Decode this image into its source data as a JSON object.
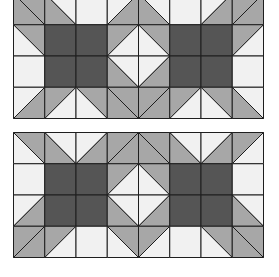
{
  "colors": {
    "white": "#f1f1f1",
    "gray": "#a7a7a7",
    "dark": "#555555",
    "line": "#1e1e1e"
  },
  "cell_size": 31.25,
  "legend": {
    "W": "solid white",
    "D": "solid dark",
    "a-ur": "diagonal TL-BR, upper-right gray, lower-left white",
    "a-ll": "diagonal TL-BR, lower-left gray, upper-right white",
    "a-gg": "diagonal TL-BR, both halves gray",
    "b-ul": "diagonal BL-TR, upper-left gray, lower-right white",
    "b-lr": "diagonal BL-TR, lower-right gray, upper-left white",
    "b-gg": "diagonal BL-TR, both halves gray"
  },
  "panels": [
    {
      "name": "top-quilt-panel",
      "x": 13,
      "y": 0,
      "width": 250,
      "height": 120,
      "grid_offset_y": -7,
      "rows": [
        [
          "a-gg",
          "a-ll",
          "W",
          "b-lr",
          "a-ll",
          "W",
          "b-lr",
          "b-gg"
        ],
        [
          "a-ur",
          "D",
          "D",
          "b-ul",
          "a-ur",
          "D",
          "D",
          "b-ul"
        ],
        [
          "W",
          "D",
          "D",
          "a-ll",
          "b-lr",
          "D",
          "D",
          "W"
        ],
        [
          "b-lr",
          "b-ul",
          "a-ur",
          "a-gg",
          "b-gg",
          "b-ul",
          "a-ur",
          "a-ll"
        ]
      ]
    },
    {
      "name": "bottom-quilt-panel",
      "x": 13,
      "y": 132,
      "width": 250,
      "height": 127,
      "grid_offset_y": 0,
      "rows": [
        [
          "a-ur",
          "a-ll",
          "b-lr",
          "b-gg",
          "a-gg",
          "a-ll",
          "b-lr",
          "b-ul"
        ],
        [
          "W",
          "D",
          "D",
          "b-ul",
          "a-ur",
          "D",
          "D",
          "W"
        ],
        [
          "b-lr",
          "D",
          "D",
          "a-ll",
          "b-lr",
          "D",
          "D",
          "a-ll"
        ],
        [
          "b-gg",
          "b-ul",
          "W",
          "a-ur",
          "b-ul",
          "W",
          "a-ur",
          "a-gg"
        ]
      ]
    }
  ]
}
